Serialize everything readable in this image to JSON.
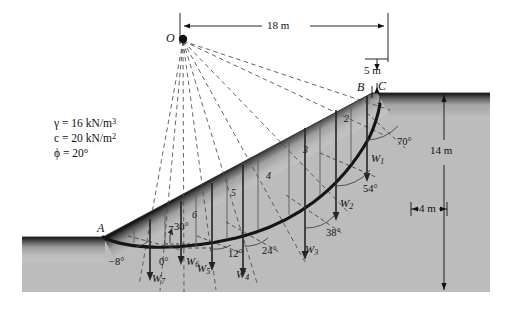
{
  "figure": {
    "type": "slope-stability-slice-method-diagram",
    "background_color": "#ffffff",
    "soil_fill_color": "#b9b9b9",
    "surface_dark_color": "#1a1a1a",
    "line_color": "#111111"
  },
  "soil_properties": {
    "unit_weight": "γ = 16 kN/m",
    "unit_weight_exp": "3",
    "cohesion": "c = 20 kN/m",
    "cohesion_exp": "2",
    "friction_angle": "ϕ = 20°"
  },
  "points": {
    "center": "O",
    "toe": "A",
    "crest_inner": "B",
    "crest_outer": "C"
  },
  "dimensions": {
    "horizontal_top": "18 m",
    "vertical_crest": "5 m",
    "depth_right": "14 m",
    "offset_right": "4 m"
  },
  "slope_angle": "30°",
  "slices": [
    {
      "number": "1",
      "weight": "W",
      "weight_sub": "1",
      "alpha": "70°"
    },
    {
      "number": "2",
      "weight": "W",
      "weight_sub": "2",
      "alpha": "54°"
    },
    {
      "number": "3",
      "weight": "W",
      "weight_sub": "3",
      "alpha": "38°"
    },
    {
      "number": "4",
      "weight": "W",
      "weight_sub": "4",
      "alpha": "24°"
    },
    {
      "number": "5",
      "weight": "W",
      "weight_sub": "5",
      "alpha": "12°"
    },
    {
      "number": "6",
      "weight": "W",
      "weight_sub": "6",
      "alpha": "0°"
    },
    {
      "number": "7",
      "weight": "W",
      "weight_sub": "7",
      "alpha": "−8°"
    }
  ]
}
